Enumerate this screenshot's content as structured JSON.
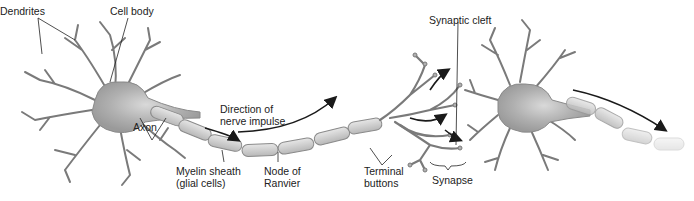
{
  "diagram": {
    "colors": {
      "cell_body": "#a8a8a8",
      "dendrite_stroke": "#6e6e6e",
      "myelin_fill": "#cfcfcf",
      "myelin_stroke": "#8a8a8a",
      "arrow": "#1a1a1a",
      "label_text": "#222222",
      "background": "#ffffff"
    },
    "labels": {
      "dendrites": "Dendrites",
      "cell_body": "Cell body",
      "axon": "Axon",
      "direction_line1": "Direction of",
      "direction_line2": "nerve impulse",
      "myelin_line1": "Myelin sheath",
      "myelin_line2": "(glial cells)",
      "node_line1": "Node of",
      "node_line2": "Ranvier",
      "terminal_line1": "Terminal",
      "terminal_line2": "buttons",
      "synaptic_cleft": "Synaptic cleft",
      "synapse": "Synapse"
    }
  }
}
